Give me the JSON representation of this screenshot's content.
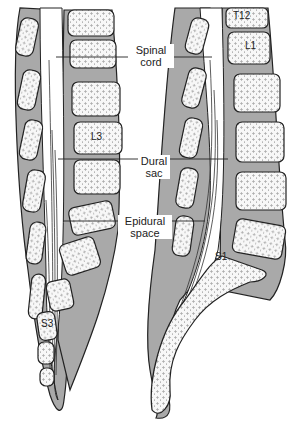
{
  "diagram": {
    "type": "anatomical-illustration",
    "labels": {
      "spinal_cord": [
        "Spinal",
        "cord"
      ],
      "dural_sac": [
        "Dural",
        "sac"
      ],
      "epidural_space": [
        "Epidural",
        "space"
      ]
    },
    "vertebra_labels": {
      "left": [
        "L3",
        "S3"
      ],
      "right": [
        "T12",
        "L1",
        "S1"
      ]
    },
    "colors": {
      "bone_fill": "#f6f6f6",
      "tissue_gray": "#a9a9a9",
      "outline": "#222222",
      "background": "#ffffff"
    }
  }
}
